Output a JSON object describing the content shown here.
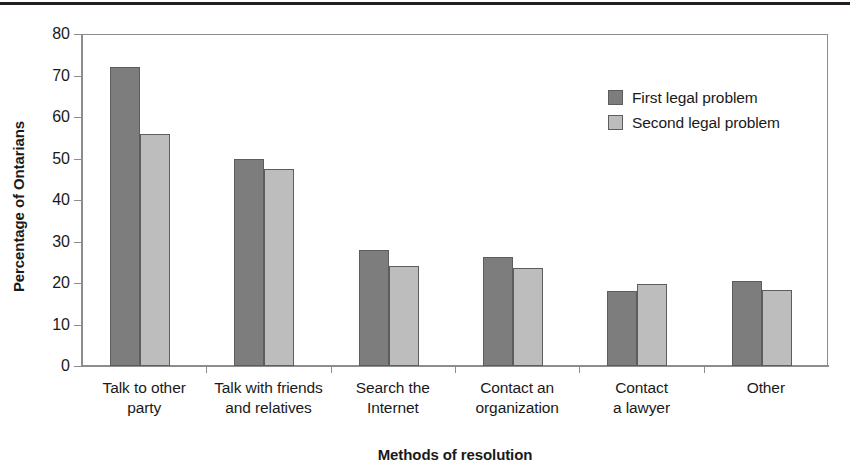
{
  "chart_data": {
    "type": "bar",
    "title": "",
    "subtitle": "",
    "xlabel": "Methods of resolution",
    "ylabel": "Percentage of Ontarians",
    "categories": [
      "Talk to other\nparty",
      "Talk with friends\nand relatives",
      "Search the\nInternet",
      "Contact an\norganization",
      "Contact\na lawyer",
      "Other"
    ],
    "category_lines": [
      [
        "Talk to other",
        "party"
      ],
      [
        "Talk with friends",
        "and relatives"
      ],
      [
        "Search the",
        "Internet"
      ],
      [
        "Contact an",
        "organization"
      ],
      [
        "Contact",
        "a lawyer"
      ],
      [
        "Other"
      ]
    ],
    "series": [
      {
        "name": "First legal problem",
        "color": "#7d7d7d",
        "values": [
          72,
          49.8,
          28,
          26.2,
          18,
          20.5
        ]
      },
      {
        "name": "Second legal problem",
        "color": "#bdbdbd",
        "values": [
          56,
          47.4,
          24,
          23.7,
          19.8,
          18.2
        ]
      }
    ],
    "ylim": [
      0,
      80
    ],
    "ytick_step": 10,
    "ytick_labels": [
      "80",
      "70",
      "60",
      "50",
      "40",
      "30",
      "20",
      "10",
      "0"
    ],
    "ytick_values": [
      80,
      70,
      60,
      50,
      40,
      30,
      20,
      10,
      0
    ],
    "grid": false,
    "legend_position": "top-right-inside",
    "bar_edge_color": "#5d5d5d",
    "axis_color": "#8d8d8d",
    "rule_color": "#231f20"
  },
  "legend": {
    "entries": [
      {
        "label": "First legal problem"
      },
      {
        "label": "Second legal problem"
      }
    ]
  }
}
